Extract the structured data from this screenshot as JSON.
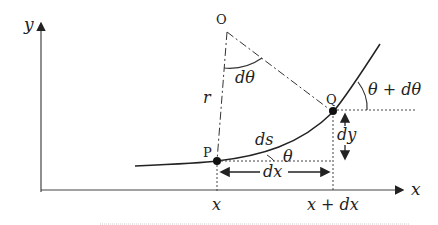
{
  "labels": {
    "y_axis": "y",
    "x_axis": "x",
    "origin": "O",
    "point_p": "P",
    "point_q": "Q",
    "radius": "r",
    "d_theta": "dθ",
    "theta": "θ",
    "theta_plus": "θ + dθ",
    "ds": "ds",
    "dx": "dx",
    "dy": "dy",
    "x_tick": "x",
    "x_plus_dx_tick": "x + dx"
  }
}
